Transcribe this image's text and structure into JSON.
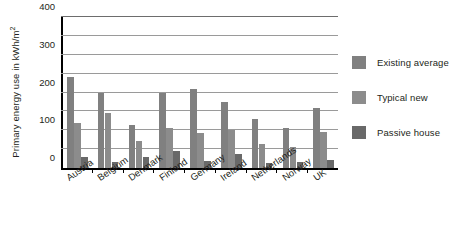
{
  "chart_data": {
    "type": "bar",
    "title": "",
    "xlabel": "",
    "ylabel": "Primary energy use in kWh/m",
    "ylabel_superscript": "2",
    "ylim": [
      0,
      400
    ],
    "yticks": [
      0,
      100,
      200,
      300,
      400
    ],
    "ytick_labels": [
      "0",
      "100",
      "200",
      "300",
      "400"
    ],
    "gridlines": [
      50,
      100,
      150,
      200,
      250,
      300,
      350,
      400
    ],
    "grid": true,
    "legend_position": "right",
    "categories": [
      "Austria",
      "Belgium",
      "Denmark",
      "Finland",
      "Germany",
      "Ireland",
      "Netherlands",
      "Norway",
      "UK"
    ],
    "series": [
      {
        "name": "Existing average",
        "color": "#808080",
        "values": [
          240,
          198,
          115,
          198,
          210,
          175,
          130,
          105,
          160
        ]
      },
      {
        "name": "Typical new",
        "color": "#8c8c8c",
        "values": [
          120,
          145,
          72,
          105,
          92,
          100,
          63,
          55,
          95
        ]
      },
      {
        "name": "Passive house",
        "color": "#696969",
        "values": [
          30,
          17,
          30,
          45,
          18,
          38,
          12,
          15,
          22
        ]
      }
    ]
  }
}
